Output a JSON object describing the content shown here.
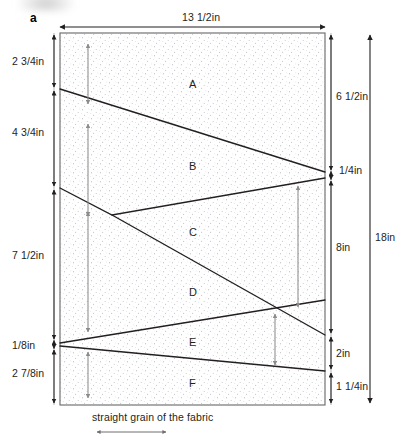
{
  "figure": {
    "panel_label": "a",
    "grain_note": "straight grain of the fabric"
  },
  "regions": [
    {
      "id": "A",
      "label": "A"
    },
    {
      "id": "B",
      "label": "B"
    },
    {
      "id": "C",
      "label": "C"
    },
    {
      "id": "D",
      "label": "D"
    },
    {
      "id": "E",
      "label": "E"
    },
    {
      "id": "F",
      "label": "F"
    }
  ],
  "dimensions": {
    "top": {
      "label": "13 1/2in"
    },
    "left": [
      {
        "label": "2 3/4in"
      },
      {
        "label": "4 3/4in"
      },
      {
        "label": "7 1/2in"
      },
      {
        "label": "1/8in"
      },
      {
        "label": "2 7/8in"
      }
    ],
    "right_inner": [
      {
        "label": "6 1/2in"
      },
      {
        "label": "1/4in"
      },
      {
        "label": "8in"
      },
      {
        "label": "2in"
      },
      {
        "label": "1 1/4in"
      }
    ],
    "right_outer": {
      "label": "18in"
    }
  },
  "colors": {
    "line": "#231f20",
    "fabric_fill": "#ffffff",
    "speckle": "#8a8fa0",
    "dimension_gray": "#8c8c8c",
    "border": "#555555"
  }
}
